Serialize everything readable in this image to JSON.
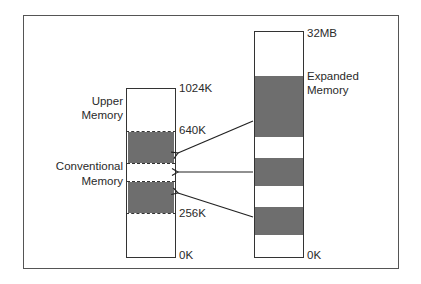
{
  "diagram": {
    "conventional_column": {
      "labels": {
        "top": "1024K",
        "upper_boundary": "640K",
        "lower_boundary": "256K",
        "bottom": "0K"
      },
      "regions": {
        "upper": "Upper\nMemory",
        "conventional": "Conventional\nMemory"
      },
      "upper_label_line1": "Upper",
      "upper_label_line2": "Memory",
      "conventional_label_line1": "Conventional",
      "conventional_label_line2": "Memory"
    },
    "expanded_column": {
      "labels": {
        "top": "32MB",
        "bottom": "0K"
      },
      "region_label_line1": "Expanded",
      "region_label_line2": "Memory"
    },
    "arrows": [
      {
        "from": "expanded-block-1",
        "to": "conventional-page-1"
      },
      {
        "from": "expanded-block-2",
        "to": "conventional-page-2"
      },
      {
        "from": "expanded-block-3",
        "to": "conventional-page-3"
      }
    ],
    "colors": {
      "block_fill": "#6e6e6e",
      "line": "#333333",
      "text": "#2a2a2a"
    }
  }
}
